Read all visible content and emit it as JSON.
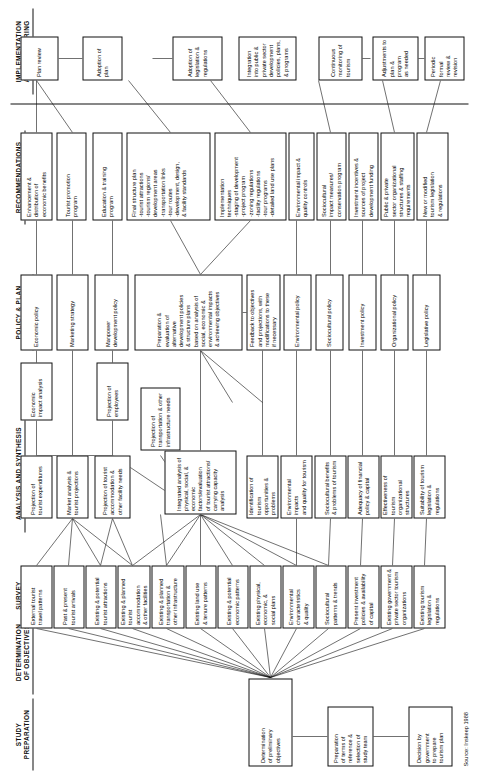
{
  "figure": {
    "source_note": "Source: Inskeep 1988",
    "orientation": "rotated-90"
  },
  "stages": [
    {
      "id": "study-preparation",
      "label": "STUDY\nPREPARATION"
    },
    {
      "id": "determination",
      "label": "DETERMINATION\nOF OBJECTIVES"
    },
    {
      "id": "survey",
      "label": "SURVEY"
    },
    {
      "id": "analysis",
      "label": "ANALYSIS AND SYNTHESIS"
    },
    {
      "id": "policy",
      "label": "POLICY & PLAN\nFORMULATION"
    },
    {
      "id": "recommendations",
      "label": "RECOMMENDATIONS"
    },
    {
      "id": "implementation",
      "label": "IMPLEMENTATION\nAND MONITORING"
    }
  ],
  "nodes": {
    "prep1": "Decision by\ngovernment\nto prepare\ntourism plan",
    "prep2": "Preparation\nof terms of\nreference &\nselection of\nstudy team",
    "obj1": "Determination\nof preliminary\nobjectives",
    "s1": "External tourist\ntravel patterns",
    "s2": "Past & present\ntourist arrivals",
    "s3": "Existing & potential\ntourist attractions",
    "s4": "Existing & planned\ntourist accommodation\n& other facilities",
    "s5": "Existing & planned\ntransportation &\nother infrastructure",
    "s6": "Existing land use\n& tenure patterns",
    "s7": "Existing & potential\neconomic patterns",
    "s8": "Existing physical,\neconomic, &\nsocial plans",
    "s9": "Environmental\ncharacteristics\n& quality",
    "s10": "Sociocultural\npatterns & trends",
    "s11": "Present investment\npolicies & availability\nof capital",
    "s12": "Existing government &\nprivate sector tourism\norganizations",
    "s13": "Existing tourism\nlegislation &\nregulations",
    "a1": "Projection of\ntourist expenditures",
    "a2": "Market analysis &\ntourist projections",
    "a3": "Projection of tourist\naccommodation &\nother facility needs",
    "a4": "Projection of\ntransportation & other\ninfrastructure needs",
    "a5": "Integrated analysis of\nphysical, social, &\neconomic factors/evaluation\nof tourist attractions/\ncarrying capacity analysis",
    "a6": "Identification of tourism\nopportunities & problems",
    "a7": "Environmental impacts\nand quality for tourism",
    "a8": "Sociocultural benefits\n& problems of tourism",
    "a9": "Adequacy of financial\npolicy & capital",
    "a10": "Effectiveness of tourism\norganizational structures",
    "a11": "Suitability of tourism\nlegislation & regulations",
    "a12": "Economic\nimpact analysis",
    "a13": "Projection of\nemployees",
    "p1": "Economic policy",
    "p2": "Marketing strategy",
    "p3": "Manpower\ndevelopment policy",
    "p4": "Preparation &\nevaluation of\nalternative\ndevelopment policies\n& structure plans\nbased on analysis of\nsocial, economic &\nenvironmental impacts\n& achieving objectives",
    "p5": "Feedback to objectives\nand projections, with\nmodifications to these\nif necessary",
    "p6": "Environmental policy",
    "p7": "Sociocultural policy",
    "p8": "Investment policy",
    "p9": "Organizational policy",
    "p10": "Legislative policy",
    "r1": "Enhancement &\ndistribution of\neconomic benefits",
    "r2": "Tourist promotion\nprogram",
    "r3": "Education & training\nprogram",
    "r4": "Final structure plan\n-tourist attractions\n-tourism regions/\n development areas\n-transportation links\n-tour routes\n-development, design,\n & facility standards",
    "r5": "Implementation\ntechniques\n-staging of development\n-project program\n-zoning regulations\n-facility regulations\n-tour programs\n-detailed land use plans",
    "r6": "Environmental impact &\nquality controls",
    "r7": "Sociocultural\nimpact measures/\nconservation program",
    "r8": "Investment incentives &\nsources of project\ndevelopment funding",
    "r9": "Public & private\nsector organizational\nstructures & staffing\nrequirements",
    "r10": "New or modified\ntourism legislation\n& regulations",
    "i1": "Plan review",
    "i2": "Adoption of plan",
    "i3": "Adoption of\nlegislation &\nregulations",
    "i4": "Integration\ninto public &\nprivate sector\ndevelopment\npolicies, plans,\n& programs",
    "i5": "Continuous\nmonitoring of\ntourism",
    "i6": "Adjustments to\nplan & program\nas needed",
    "i7": "Periodic formal\nreview & revision"
  }
}
